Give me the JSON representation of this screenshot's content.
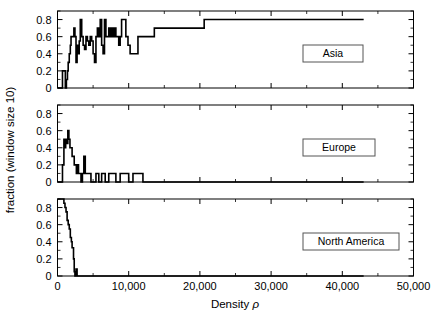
{
  "figure": {
    "title": "",
    "y_axis_label": "fraction (window size 10)",
    "x_axis_label_prefix": "Density",
    "x_axis_label_symbol": "ρ",
    "background": "#ffffff",
    "line_color": "#000000"
  },
  "chart_data": {
    "type": "line",
    "title": "",
    "xlabel": "Density ρ",
    "ylabel": "fraction (window size 10)",
    "xlim": [
      0,
      50000
    ],
    "ylim": [
      0,
      0.9
    ],
    "grid": false,
    "legend_position": "inside-right",
    "x_ticks": [
      0,
      10000,
      20000,
      30000,
      40000,
      50000
    ],
    "x_tick_labels": [
      "0",
      "10,000",
      "20,000",
      "30,000",
      "40,000",
      "50,000"
    ],
    "x_minor_tick_interval": 5000,
    "y_ticks": [
      0,
      0.2,
      0.4,
      0.6,
      0.8
    ],
    "y_tick_labels": [
      "0",
      "0.2",
      "0.4",
      "0.6",
      "0.8"
    ],
    "y_minor_tick_interval": 0.1,
    "panels": [
      {
        "name": "Asia",
        "legend_label": "Asia",
        "step_shape": "hv",
        "x": [
          0,
          400,
          700,
          900,
          1100,
          1250,
          1400,
          1500,
          1650,
          1800,
          1900,
          2000,
          2150,
          2300,
          2450,
          2600,
          2750,
          2900,
          3050,
          3200,
          3400,
          3600,
          3800,
          4000,
          4200,
          4400,
          4600,
          4800,
          5000,
          5200,
          5400,
          5600,
          5800,
          6000,
          6200,
          6400,
          6600,
          6800,
          7000,
          7200,
          7400,
          7600,
          7800,
          8000,
          8200,
          8400,
          8600,
          8800,
          9000,
          9300,
          9600,
          9900,
          10200,
          10500,
          10900,
          11300,
          11700,
          12100,
          12600,
          13100,
          13600,
          14100,
          14700,
          15300,
          16000,
          16800,
          17600,
          18400,
          19200,
          20100,
          20600,
          21200,
          43000
        ],
        "y": [
          0.0,
          0.0,
          0.2,
          0.2,
          0.0,
          0.1,
          0.2,
          0.3,
          0.4,
          0.5,
          0.6,
          0.6,
          0.6,
          0.7,
          0.6,
          0.3,
          0.5,
          0.4,
          0.55,
          0.8,
          0.6,
          0.5,
          0.45,
          0.6,
          0.55,
          0.5,
          0.6,
          0.55,
          0.4,
          0.3,
          0.6,
          0.7,
          0.6,
          0.8,
          0.5,
          0.4,
          0.8,
          0.6,
          0.6,
          0.7,
          0.6,
          0.7,
          0.6,
          0.7,
          0.6,
          0.6,
          0.5,
          0.6,
          0.8,
          0.8,
          0.6,
          0.5,
          0.4,
          0.4,
          0.4,
          0.6,
          0.6,
          0.6,
          0.6,
          0.6,
          0.7,
          0.7,
          0.7,
          0.7,
          0.7,
          0.7,
          0.7,
          0.7,
          0.7,
          0.7,
          0.8,
          0.8,
          0.8
        ]
      },
      {
        "name": "Europe",
        "legend_label": "Europe",
        "step_shape": "hv",
        "x": [
          0,
          500,
          700,
          900,
          1000,
          1150,
          1300,
          1450,
          1600,
          1750,
          1900,
          2050,
          2200,
          2350,
          2500,
          2650,
          2800,
          2950,
          3100,
          3300,
          3500,
          3700,
          3900,
          4100,
          4400,
          4700,
          5000,
          5400,
          5800,
          6200,
          6700,
          7200,
          7700,
          8200,
          8800,
          9400,
          10000,
          10600,
          11200,
          12000,
          43000
        ],
        "y": [
          0.0,
          0.0,
          0.2,
          0.5,
          0.4,
          0.5,
          0.45,
          0.6,
          0.5,
          0.4,
          0.4,
          0.3,
          0.3,
          0.2,
          0.2,
          0.1,
          0.2,
          0.1,
          0.1,
          0.0,
          0.1,
          0.3,
          0.1,
          0.1,
          0.1,
          0.0,
          0.0,
          0.1,
          0.0,
          0.1,
          0.0,
          0.1,
          0.1,
          0.0,
          0.1,
          0.1,
          0.0,
          0.1,
          0.1,
          0.0,
          0.0
        ]
      },
      {
        "name": "North America",
        "legend_label": "North America",
        "step_shape": "hv",
        "x": [
          0,
          700,
          900,
          1050,
          1200,
          1350,
          1500,
          1650,
          1800,
          1950,
          2050,
          2150,
          2250,
          2350,
          2450,
          2600,
          2750,
          2900,
          3050,
          3400,
          43000
        ],
        "y": [
          0.9,
          0.9,
          0.85,
          0.8,
          0.75,
          0.65,
          0.6,
          0.55,
          0.45,
          0.4,
          0.33,
          0.33,
          0.2,
          0.05,
          0.0,
          0.08,
          0.0,
          0.0,
          0.0,
          0.0,
          0.0
        ]
      }
    ]
  }
}
